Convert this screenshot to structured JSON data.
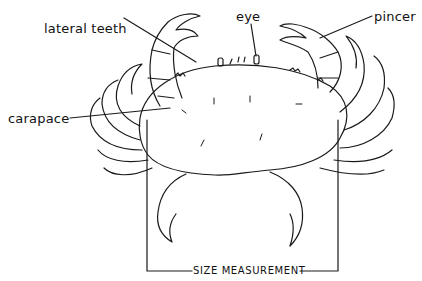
{
  "diagram": {
    "labels": {
      "lateral_teeth": "lateral teeth",
      "eye": "eye",
      "pincer": "pincer",
      "carapace": "carapace",
      "size_measurement": "SIZE MEASUREMENT"
    },
    "colors": {
      "line": "#1a1a1a",
      "background": "#ffffff"
    }
  }
}
